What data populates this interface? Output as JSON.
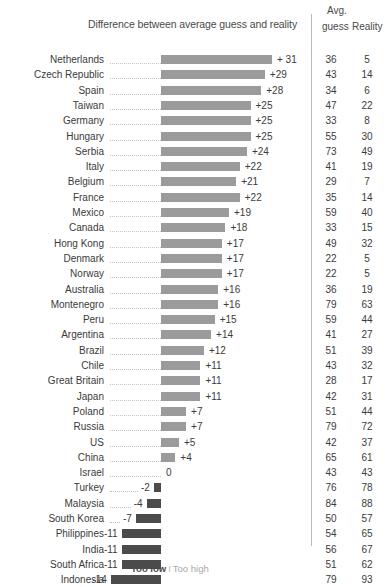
{
  "header": {
    "title": "Difference between average guess and reality",
    "avg_line1": "Avg.",
    "guess": "guess",
    "reality": "Reality"
  },
  "legend": {
    "too_low": "Too low",
    "separator": "I",
    "too_high": "Too high"
  },
  "colors": {
    "positive_bar": "#9b9b9b",
    "negative_bar": "#4b4b4b",
    "text": "#3b3b3b",
    "leader_line": "#c2c2c2",
    "divider": "#b9b9b9"
  },
  "chart_data": {
    "type": "bar",
    "title": "Difference between average guess and reality",
    "xlabel": "",
    "ylabel": "",
    "orientation": "horizontal",
    "grid": false,
    "legend_position": "bottom",
    "baseline": 0,
    "xlim": [
      -14,
      31
    ],
    "columns": [
      "Country",
      "Difference",
      "Avg. guess",
      "Reality"
    ],
    "categories": [
      "Netherlands",
      "Czech Republic",
      "Spain",
      "Taiwan",
      "Germany",
      "Hungary",
      "Serbia",
      "Italy",
      "Belgium",
      "France",
      "Mexico",
      "Canada",
      "Hong Kong",
      "Denmark",
      "Norway",
      "Australia",
      "Montenegro",
      "Peru",
      "Argentina",
      "Brazil",
      "Chile",
      "Great Britain",
      "Japan",
      "Poland",
      "Russia",
      "US",
      "China",
      "Israel",
      "Turkey",
      "Malaysia",
      "South Korea",
      "Philippines",
      "India",
      "South Africa",
      "Indonesia"
    ],
    "values": [
      31,
      29,
      28,
      25,
      25,
      25,
      24,
      22,
      21,
      22,
      19,
      18,
      17,
      17,
      17,
      16,
      16,
      15,
      14,
      12,
      11,
      11,
      11,
      7,
      7,
      5,
      4,
      0,
      -2,
      -4,
      -7,
      -11,
      -11,
      -11,
      -14
    ],
    "series": [
      {
        "name": "Avg. guess",
        "values": [
          36,
          43,
          34,
          47,
          33,
          55,
          73,
          41,
          29,
          35,
          59,
          33,
          49,
          22,
          22,
          36,
          79,
          59,
          41,
          51,
          43,
          28,
          42,
          51,
          79,
          42,
          65,
          43,
          76,
          84,
          50,
          54,
          56,
          51,
          79
        ]
      },
      {
        "name": "Reality",
        "values": [
          5,
          14,
          6,
          22,
          8,
          30,
          49,
          19,
          7,
          14,
          40,
          15,
          32,
          5,
          5,
          19,
          63,
          44,
          27,
          39,
          32,
          17,
          31,
          44,
          72,
          37,
          61,
          43,
          78,
          88,
          57,
          65,
          67,
          62,
          93
        ]
      }
    ],
    "rows": [
      {
        "country": "Netherlands",
        "diff": 31,
        "diff_label": "+ 31",
        "guess": 36,
        "reality": 5
      },
      {
        "country": "Czech Republic",
        "diff": 29,
        "diff_label": "+29",
        "guess": 43,
        "reality": 14
      },
      {
        "country": "Spain",
        "diff": 28,
        "diff_label": "+28",
        "guess": 34,
        "reality": 6
      },
      {
        "country": "Taiwan",
        "diff": 25,
        "diff_label": "+25",
        "guess": 47,
        "reality": 22
      },
      {
        "country": "Germany",
        "diff": 25,
        "diff_label": "+25",
        "guess": 33,
        "reality": 8
      },
      {
        "country": "Hungary",
        "diff": 25,
        "diff_label": "+25",
        "guess": 55,
        "reality": 30
      },
      {
        "country": "Serbia",
        "diff": 24,
        "diff_label": "+24",
        "guess": 73,
        "reality": 49
      },
      {
        "country": "Italy",
        "diff": 22,
        "diff_label": "+22",
        "guess": 41,
        "reality": 19
      },
      {
        "country": "Belgium",
        "diff": 21,
        "diff_label": "+21",
        "guess": 29,
        "reality": 7
      },
      {
        "country": "France",
        "diff": 22,
        "diff_label": "+22",
        "guess": 35,
        "reality": 14
      },
      {
        "country": "Mexico",
        "diff": 19,
        "diff_label": "+19",
        "guess": 59,
        "reality": 40
      },
      {
        "country": "Canada",
        "diff": 18,
        "diff_label": "+18",
        "guess": 33,
        "reality": 15
      },
      {
        "country": "Hong Kong",
        "diff": 17,
        "diff_label": "+17",
        "guess": 49,
        "reality": 32
      },
      {
        "country": "Denmark",
        "diff": 17,
        "diff_label": "+17",
        "guess": 22,
        "reality": 5
      },
      {
        "country": "Norway",
        "diff": 17,
        "diff_label": "+17",
        "guess": 22,
        "reality": 5
      },
      {
        "country": "Australia",
        "diff": 16,
        "diff_label": "+16",
        "guess": 36,
        "reality": 19
      },
      {
        "country": "Montenegro",
        "diff": 16,
        "diff_label": "+16",
        "guess": 79,
        "reality": 63
      },
      {
        "country": "Peru",
        "diff": 15,
        "diff_label": "+15",
        "guess": 59,
        "reality": 44
      },
      {
        "country": "Argentina",
        "diff": 14,
        "diff_label": "+14",
        "guess": 41,
        "reality": 27
      },
      {
        "country": "Brazil",
        "diff": 12,
        "diff_label": "+12",
        "guess": 51,
        "reality": 39
      },
      {
        "country": "Chile",
        "diff": 11,
        "diff_label": "+11",
        "guess": 43,
        "reality": 32
      },
      {
        "country": "Great Britain",
        "diff": 11,
        "diff_label": "+11",
        "guess": 28,
        "reality": 17
      },
      {
        "country": "Japan",
        "diff": 11,
        "diff_label": "+11",
        "guess": 42,
        "reality": 31
      },
      {
        "country": "Poland",
        "diff": 7,
        "diff_label": "+7",
        "guess": 51,
        "reality": 44
      },
      {
        "country": "Russia",
        "diff": 7,
        "diff_label": "+7",
        "guess": 79,
        "reality": 72
      },
      {
        "country": "US",
        "diff": 5,
        "diff_label": "+5",
        "guess": 42,
        "reality": 37
      },
      {
        "country": "China",
        "diff": 4,
        "diff_label": "+4",
        "guess": 65,
        "reality": 61
      },
      {
        "country": "Israel",
        "diff": 0,
        "diff_label": "0",
        "guess": 43,
        "reality": 43
      },
      {
        "country": "Turkey",
        "diff": -2,
        "diff_label": "-2",
        "guess": 76,
        "reality": 78
      },
      {
        "country": "Malaysia",
        "diff": -4,
        "diff_label": "-4",
        "guess": 84,
        "reality": 88
      },
      {
        "country": "South Korea",
        "diff": -7,
        "diff_label": "-7",
        "guess": 50,
        "reality": 57
      },
      {
        "country": "Philippines",
        "diff": -11,
        "diff_label": "-11",
        "guess": 54,
        "reality": 65
      },
      {
        "country": "India",
        "diff": -11,
        "diff_label": "-11",
        "guess": 56,
        "reality": 67
      },
      {
        "country": "South Africa",
        "diff": -11,
        "diff_label": "-11",
        "guess": 51,
        "reality": 62
      },
      {
        "country": "Indonesia",
        "diff": -14,
        "diff_label": "-14",
        "guess": 79,
        "reality": 93
      }
    ]
  }
}
